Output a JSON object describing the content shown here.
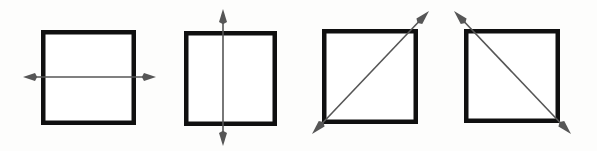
{
  "figure": {
    "background_color": "#fdfdfc",
    "square_stroke_color": "#101010",
    "square_fill_color": "#ffffff",
    "square_stroke_width": 4.5,
    "arrow_color": "#565656",
    "arrow_stroke_width": 1.6,
    "panel_count": 4,
    "panels": [
      {
        "index": 1,
        "name": "square-with-horizontal-symmetry-line",
        "axis_label": "horizontal",
        "square": {
          "x": 41,
          "y": 30,
          "width": 95,
          "height": 95
        },
        "arrow": {
          "type": "double-headed",
          "x1": 23,
          "y1": 77,
          "x2": 156,
          "y2": 77,
          "head_length": 12,
          "head_width": 8
        }
      },
      {
        "index": 2,
        "name": "square-with-vertical-symmetry-line",
        "axis_label": "vertical",
        "square": {
          "x": 184,
          "y": 31,
          "width": 93,
          "height": 95
        },
        "arrow": {
          "type": "double-headed",
          "x1": 223,
          "y1": 9,
          "x2": 223,
          "y2": 146,
          "head_length": 13,
          "head_width": 8
        }
      },
      {
        "index": 3,
        "name": "square-with-rising-diagonal-symmetry-line",
        "axis_label": "diagonal-bottom-left-to-top-right",
        "square": {
          "x": 322,
          "y": 29,
          "width": 96,
          "height": 95
        },
        "arrow": {
          "type": "double-headed",
          "x1": 312,
          "y1": 134,
          "x2": 429,
          "y2": 11,
          "head_length": 14,
          "head_width": 8
        }
      },
      {
        "index": 4,
        "name": "square-with-falling-diagonal-symmetry-line",
        "axis_label": "diagonal-top-left-to-bottom-right",
        "square": {
          "x": 464,
          "y": 29,
          "width": 96,
          "height": 94
        },
        "arrow": {
          "type": "double-headed",
          "x1": 454,
          "y1": 11,
          "x2": 571,
          "y2": 134,
          "head_length": 14,
          "head_width": 8
        }
      }
    ]
  }
}
